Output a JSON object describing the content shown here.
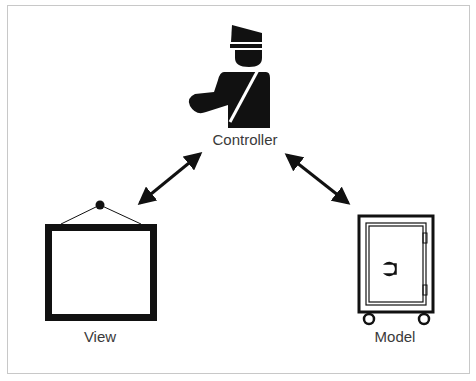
{
  "diagram": {
    "nodes": [
      {
        "id": "controller",
        "label": "Controller",
        "icon": "traffic-officer-icon"
      },
      {
        "id": "view",
        "label": "View",
        "icon": "picture-frame-icon"
      },
      {
        "id": "model",
        "label": "Model",
        "icon": "safe-icon"
      }
    ],
    "edges": [
      {
        "from": "controller",
        "to": "view",
        "type": "bidirectional"
      },
      {
        "from": "controller",
        "to": "model",
        "type": "bidirectional"
      }
    ],
    "colors": {
      "ink": "#111111",
      "label": "#3a3a3a",
      "border": "#c8c8c8"
    }
  }
}
